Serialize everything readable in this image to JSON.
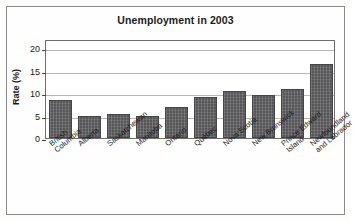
{
  "chart_data": {
    "type": "bar",
    "title": "Unemployment in 2003",
    "xlabel": "",
    "ylabel": "Rate (%)",
    "ylim": [
      0,
      22
    ],
    "yticks": [
      0,
      5,
      10,
      15,
      20
    ],
    "ytick_labels": [
      "0",
      "5",
      "10",
      "15",
      "20"
    ],
    "grid": true,
    "legend": "none",
    "bar_color": "#57575a",
    "categories": [
      "British\nColumbia",
      "Alberta",
      "Saskatchewan",
      "Manitoba",
      "Ontario",
      "Québec",
      "Nova Scotia",
      "New Brunswick",
      "Prince Edward\nIsland",
      "Newfoundland\nand Labrador"
    ],
    "values": [
      8.5,
      5.0,
      5.4,
      4.9,
      7.0,
      9.2,
      10.4,
      9.5,
      10.8,
      16.5
    ]
  },
  "colors": {
    "bar": "#57575a",
    "grid": "#b9b9b6",
    "axis": "#6e6e6c",
    "frame": "#8a8a88",
    "text": "#1b1b1b",
    "background": "#fefefe"
  }
}
